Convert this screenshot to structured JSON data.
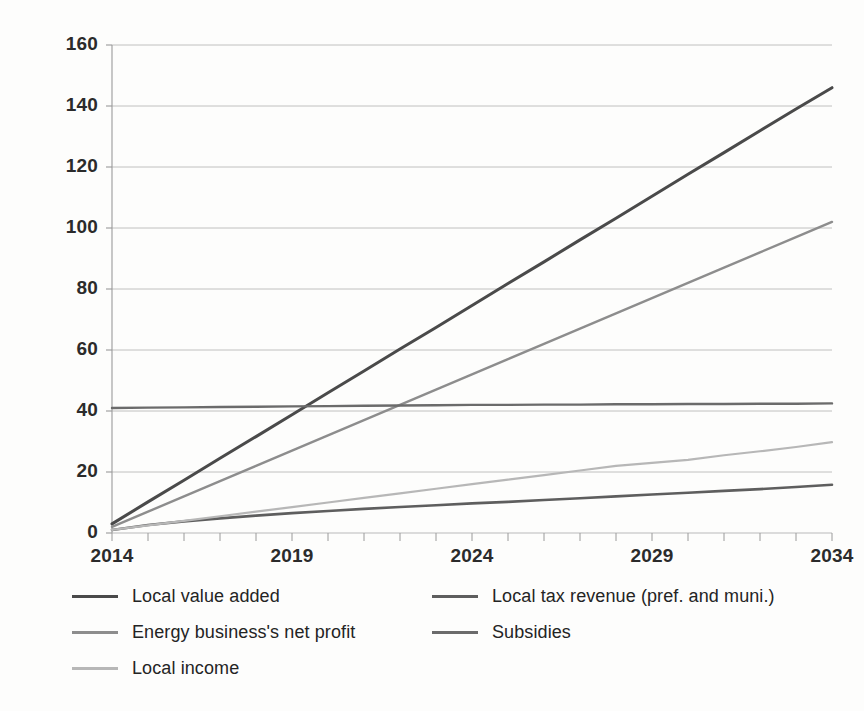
{
  "chart_data": {
    "type": "line",
    "title": "",
    "xlabel": "",
    "ylabel": "",
    "x": [
      2014,
      2015,
      2016,
      2017,
      2018,
      2019,
      2020,
      2021,
      2022,
      2023,
      2024,
      2025,
      2026,
      2027,
      2028,
      2029,
      2030,
      2031,
      2032,
      2033,
      2034
    ],
    "xlim": [
      2014,
      2034
    ],
    "ylim": [
      0,
      160
    ],
    "yticks": [
      0,
      20,
      40,
      60,
      80,
      100,
      120,
      140,
      160
    ],
    "xticks_labeled": [
      2014,
      2019,
      2024,
      2029,
      2034
    ],
    "xtick_labels": [
      "2014",
      "2019",
      "2024",
      "2029",
      "2034"
    ],
    "ytick_labels": [
      "0",
      "20",
      "40",
      "60",
      "80",
      "100",
      "120",
      "140",
      "160"
    ],
    "grid": "horizontal",
    "legend_position": "bottom",
    "series": [
      {
        "name": "Local value added",
        "color": "#4a4a4a",
        "width": 3.0,
        "values": [
          3.0,
          10.2,
          17.3,
          24.5,
          31.6,
          38.8,
          46.0,
          53.1,
          60.3,
          67.4,
          74.6,
          81.8,
          88.9,
          96.1,
          103.2,
          110.4,
          117.6,
          124.7,
          131.9,
          139.0,
          146.0
        ]
      },
      {
        "name": "Local tax revenue (pref. and muni.)",
        "color": "#5e5e5e",
        "width": 2.6,
        "values": [
          1.0,
          2.6,
          3.8,
          4.8,
          5.7,
          6.5,
          7.2,
          7.9,
          8.5,
          9.1,
          9.7,
          10.2,
          10.8,
          11.4,
          12.0,
          12.6,
          13.2,
          13.8,
          14.4,
          15.1,
          15.8
        ]
      },
      {
        "name": "Energy business's net profit",
        "color": "#8d8d8d",
        "width": 2.4,
        "values": [
          2.0,
          7.0,
          12.0,
          17.0,
          22.0,
          27.0,
          32.0,
          37.0,
          42.0,
          47.0,
          52.0,
          57.0,
          62.0,
          67.0,
          72.0,
          77.0,
          82.0,
          87.0,
          92.0,
          97.0,
          102.0
        ]
      },
      {
        "name": "Subsidies",
        "color": "#6b6b6b",
        "width": 2.4,
        "values": [
          41.0,
          41.1,
          41.2,
          41.3,
          41.4,
          41.5,
          41.6,
          41.7,
          41.8,
          41.9,
          42.0,
          42.0,
          42.1,
          42.1,
          42.2,
          42.2,
          42.3,
          42.3,
          42.4,
          42.4,
          42.5
        ]
      },
      {
        "name": "Local income",
        "color": "#b7b7b7",
        "width": 2.2,
        "values": [
          1.0,
          2.5,
          4.0,
          5.5,
          7.0,
          8.5,
          10.0,
          11.5,
          13.0,
          14.5,
          16.0,
          17.5,
          19.0,
          20.5,
          22.0,
          23.0,
          24.0,
          25.5,
          26.8,
          28.2,
          29.8
        ]
      }
    ]
  },
  "legend": {
    "entries": [
      {
        "label": "Local value added",
        "color": "#4a4a4a"
      },
      {
        "label": "Local tax revenue (pref. and muni.)",
        "color": "#5e5e5e"
      },
      {
        "label": "Energy business's net profit",
        "color": "#8d8d8d"
      },
      {
        "label": "Subsidies",
        "color": "#6b6b6b"
      },
      {
        "label": "Local income",
        "color": "#b7b7b7"
      }
    ]
  },
  "axes": {
    "grid_color": "#b9b9b9",
    "axis_color": "#9a9a9a",
    "tick_color": "#9a9a9a"
  }
}
